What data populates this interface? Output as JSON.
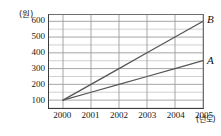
{
  "chart_data": {
    "type": "line",
    "title": "",
    "xlabel": "(년도)",
    "ylabel": "(원)",
    "x": [
      2000,
      2001,
      2002,
      2003,
      2004,
      2005
    ],
    "xtick_labels": [
      "2000",
      "2001",
      "2002",
      "2003",
      "2004",
      "2005"
    ],
    "ytick_labels": [
      "100",
      "200",
      "300",
      "400",
      "500",
      "600"
    ],
    "ytick_values": [
      100,
      200,
      300,
      400,
      500,
      600
    ],
    "xlim": [
      1999.5,
      2005.0
    ],
    "ylim": [
      50,
      640
    ],
    "grid": true,
    "minor_grid_step": 50,
    "legend_position": "right-of-line-ends",
    "series": [
      {
        "name": "B",
        "label": "B",
        "values": [
          100,
          200,
          300,
          400,
          500,
          600
        ],
        "color": "#555555"
      },
      {
        "name": "A",
        "label": "A",
        "values": [
          100,
          150,
          200,
          250,
          300,
          350
        ],
        "color": "#555555"
      }
    ]
  },
  "axis": {
    "y_unit": "(원)",
    "x_unit": "(년도)"
  },
  "colors": {
    "line": "#555555",
    "grid_major": "#9a9a9a",
    "grid_minor": "#c4c4c4",
    "axis": "#3c3c3c",
    "text": "#161616",
    "background": "#ffffff"
  }
}
